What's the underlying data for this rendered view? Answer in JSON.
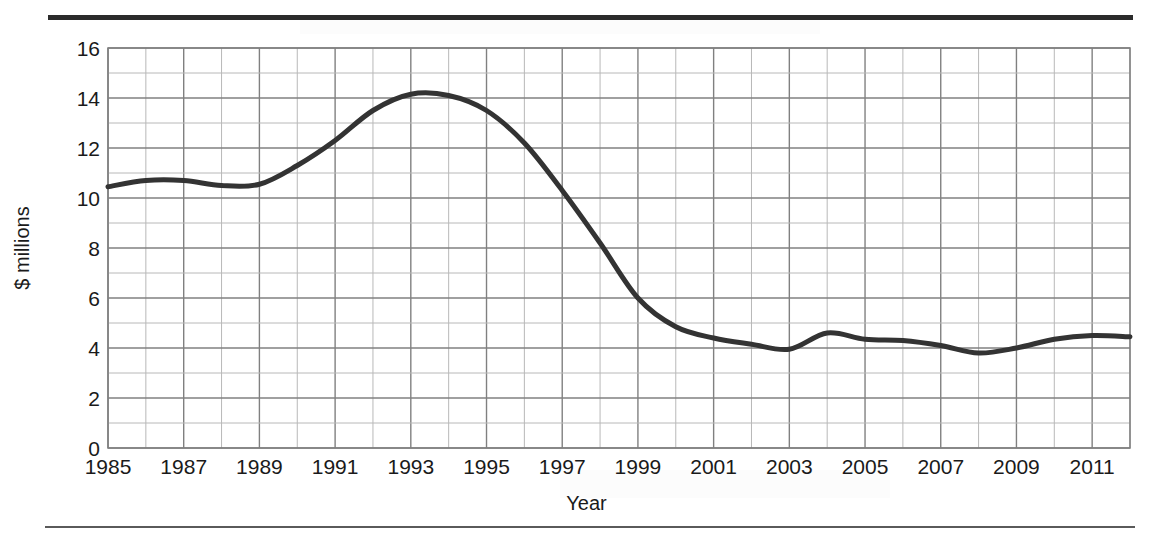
{
  "chart_data": {
    "type": "line",
    "title": "",
    "xlabel": "Year",
    "ylabel": "$ millions",
    "xlim": [
      1985,
      2012
    ],
    "ylim": [
      0,
      16
    ],
    "ytick_step": 2,
    "xtick_step": 2,
    "grid": true,
    "grid_minor": true,
    "legend": "none",
    "line_color": "#333333",
    "grid_color": "#808080",
    "minor_grid_color": "#b8b8b8",
    "yticks": [
      0,
      2,
      4,
      6,
      8,
      10,
      12,
      14,
      16
    ],
    "ytick_labels": [
      "0",
      "2",
      "4",
      "6",
      "8",
      "10",
      "12",
      "14",
      "16"
    ],
    "xticks": [
      1985,
      1987,
      1989,
      1991,
      1993,
      1995,
      1997,
      1999,
      2001,
      2003,
      2005,
      2007,
      2009,
      2011
    ],
    "xtick_labels": [
      "1985",
      "1987",
      "1989",
      "1991",
      "1993",
      "1995",
      "1997",
      "1999",
      "2001",
      "2003",
      "2005",
      "2007",
      "2009",
      "2011"
    ],
    "x": [
      1985,
      1986,
      1987,
      1988,
      1989,
      1990,
      1991,
      1992,
      1993,
      1994,
      1995,
      1996,
      1997,
      1998,
      1999,
      2000,
      2001,
      2002,
      2003,
      2004,
      2005,
      2006,
      2007,
      2008,
      2009,
      2010,
      2011,
      2012
    ],
    "values": [
      10.45,
      10.7,
      10.7,
      10.5,
      10.55,
      11.3,
      12.3,
      13.5,
      14.15,
      14.1,
      13.5,
      12.2,
      10.3,
      8.2,
      6.0,
      4.85,
      4.4,
      4.15,
      3.95,
      4.6,
      4.35,
      4.3,
      4.1,
      3.8,
      4.0,
      4.35,
      4.5,
      4.45
    ],
    "series_name": "$ millions"
  },
  "axis": {
    "ylabel": "$ millions",
    "xlabel": "Year"
  }
}
